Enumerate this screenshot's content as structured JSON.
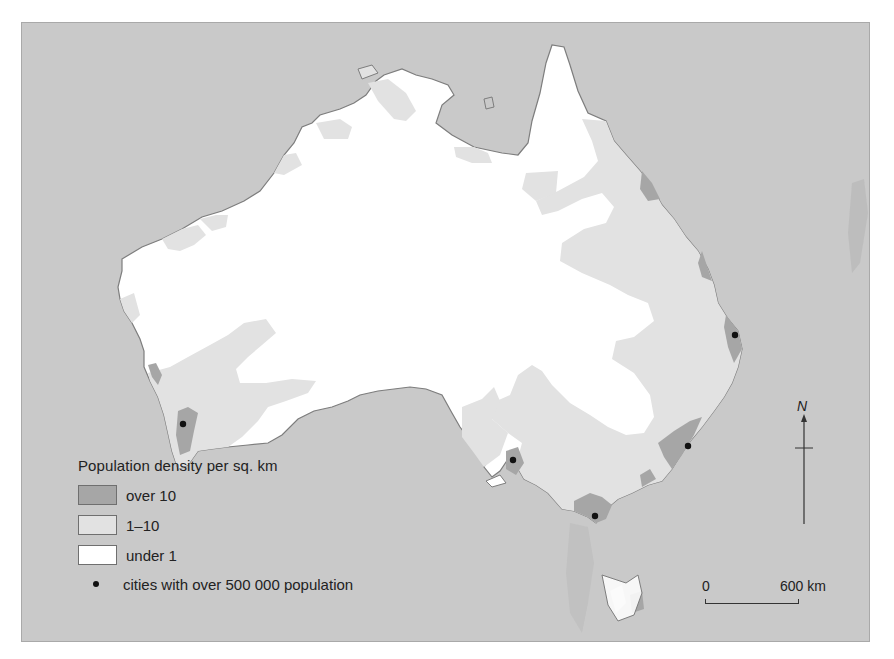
{
  "map": {
    "title": "Population density of Australia",
    "colors": {
      "sea": "#c9c9c9",
      "over_10": "#a6a6a6",
      "1_10": "#e2e2e2",
      "under_1": "#ffffff",
      "coastline": "#7d7d7d",
      "city": "#111111"
    }
  },
  "legend": {
    "title": "Population density per sq. km",
    "items": [
      {
        "label": "over 10",
        "color": "#a6a6a6"
      },
      {
        "label": "1–10",
        "color": "#e2e2e2"
      },
      {
        "label": "under 1",
        "color": "#ffffff"
      }
    ],
    "city_label": "cities with over 500 000 population"
  },
  "compass": {
    "label": "N",
    "icon": "north-arrow-icon"
  },
  "scale_bar": {
    "start": "0",
    "end": "600 km"
  },
  "cities": [
    {
      "x": 161,
      "y": 401
    },
    {
      "x": 491,
      "y": 437
    },
    {
      "x": 573,
      "y": 493
    },
    {
      "x": 666,
      "y": 423
    },
    {
      "x": 713,
      "y": 312
    }
  ]
}
